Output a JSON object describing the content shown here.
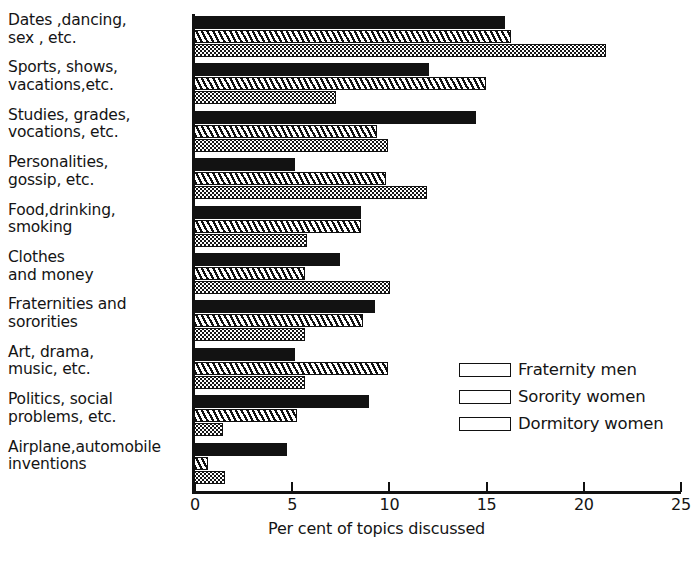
{
  "chart_data": {
    "type": "bar",
    "orientation": "horizontal",
    "title": "",
    "xlabel": "Per cent of topics discussed",
    "ylabel": "",
    "xlim": [
      0,
      25
    ],
    "xticks": [
      0,
      5,
      10,
      15,
      20,
      25
    ],
    "xtick_labels": [
      "0",
      "5",
      "10",
      "15",
      "20",
      "25"
    ],
    "grid": false,
    "legend_position": "center-right",
    "categories": [
      "Dates ,dancing,\nsex , etc.",
      "Sports, shows,\nvacations,etc.",
      "Studies, grades,\nvocations, etc.",
      "Personalities,\ngossip, etc.",
      "Food,drinking,\nsmoking",
      "Clothes\nand money",
      "Fraternities and\nsororities",
      "Art, drama,\nmusic, etc.",
      "Politics, social\nproblems, etc.",
      "Airplane,automobile\ninventions"
    ],
    "series": [
      {
        "name": "Fraternity men",
        "pattern": "solid",
        "values": [
          16.0,
          12.1,
          14.5,
          5.2,
          8.6,
          7.5,
          9.3,
          5.2,
          9.0,
          4.8
        ]
      },
      {
        "name": "Sorority women",
        "pattern": "hatch",
        "values": [
          16.3,
          15.0,
          9.4,
          9.9,
          8.6,
          5.7,
          8.7,
          10.0,
          5.3,
          0.7
        ]
      },
      {
        "name": "Dormitory women",
        "pattern": "dots",
        "values": [
          21.2,
          7.3,
          10.0,
          12.0,
          5.8,
          10.1,
          5.7,
          5.7,
          1.5,
          1.6
        ]
      }
    ]
  },
  "legend": {
    "items": [
      {
        "label": "Fraternity men",
        "pattern": "solid"
      },
      {
        "label": "Sorority women",
        "pattern": "hatch"
      },
      {
        "label": "Dormitory women",
        "pattern": "dots"
      }
    ]
  },
  "colors": {
    "ink": "#111111",
    "paper": "#ffffff"
  }
}
